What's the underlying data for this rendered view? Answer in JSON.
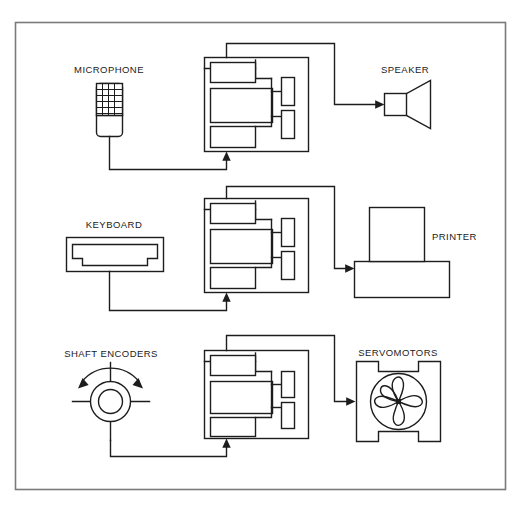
{
  "diagram": {
    "stroke_color": "#1d1d1d",
    "border_color": "#6e6e6e",
    "background_color": "#ffffff",
    "channels": [
      {
        "id": "audio",
        "input_label": "MICROPHONE",
        "input_icon": "microphone-grid-icon",
        "output_label": "SPEAKER",
        "output_icon": "speaker-cone-icon",
        "processor_icon": "processor-block-icon"
      },
      {
        "id": "text",
        "input_label": "KEYBOARD",
        "input_icon": "keyboard-icon",
        "output_label": "PRINTER",
        "output_icon": "printer-icon",
        "processor_icon": "processor-block-icon"
      },
      {
        "id": "motion",
        "input_label": "SHAFT ENCODERS",
        "input_icon": "shaft-encoder-icon",
        "output_label": "SERVOMOTORS",
        "output_icon": "servomotor-rotor-icon",
        "processor_icon": "processor-block-icon"
      }
    ],
    "labels": {
      "microphone": "MICROPHONE",
      "speaker": "SPEAKER",
      "keyboard": "KEYBOARD",
      "printer": "PRINTER",
      "shaft_encoders": "SHAFT ENCODERS",
      "servomotors": "SERVOMOTORS"
    }
  }
}
